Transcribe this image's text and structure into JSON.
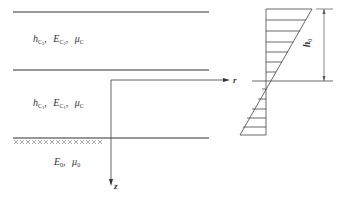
{
  "layers": [
    {
      "name": "layer-c2",
      "thickness_symbol": "h",
      "thickness_sub": "C",
      "thickness_sub2": "2",
      "modulus_symbol": "E",
      "modulus_sub": "C",
      "modulus_sub2": "2",
      "poisson_symbol": "μ",
      "poisson_sub": "C",
      "separator": ","
    },
    {
      "name": "layer-c1",
      "thickness_symbol": "h",
      "thickness_sub": "C",
      "thickness_sub2": "1",
      "modulus_symbol": "E",
      "modulus_sub": "C",
      "modulus_sub2": "1",
      "poisson_symbol": "μ",
      "poisson_sub": "C",
      "separator": ","
    },
    {
      "name": "foundation",
      "modulus_symbol": "E",
      "modulus_sub": "0",
      "poisson_symbol": "μ",
      "poisson_sub": "0",
      "separator": ","
    }
  ],
  "axes": {
    "r_label": "r",
    "z_label": "z"
  },
  "stress_diagram": {
    "dimension_symbol": "h",
    "dimension_sub": "0"
  },
  "colors": {
    "line": "#333333",
    "hatch": "#777777"
  }
}
